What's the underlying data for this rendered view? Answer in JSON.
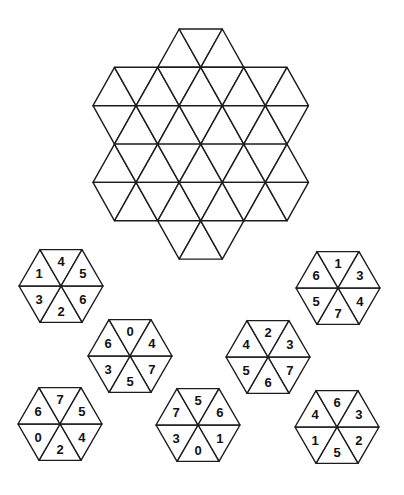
{
  "puzzle": {
    "grid": {
      "name": "triangle-grid-board",
      "origin_x": 93,
      "origin_y": 29,
      "half_side": 21.55,
      "row_height": 38.35,
      "bands": [
        {
          "row": 0,
          "upper": [
            4,
            6
          ],
          "lower": [
            3,
            5,
            7
          ]
        },
        {
          "row": 1,
          "upper": [
            1,
            3,
            5,
            7,
            9
          ],
          "lower": [
            0,
            2,
            4,
            6,
            8,
            10
          ]
        },
        {
          "row": 2,
          "upper": [
            0,
            2,
            4,
            6,
            8,
            10
          ],
          "lower": [
            1,
            3,
            5,
            7,
            9
          ]
        },
        {
          "row": 3,
          "upper": [
            1,
            3,
            5,
            7,
            9
          ],
          "lower": [
            0,
            2,
            4,
            6,
            8,
            10
          ]
        },
        {
          "row": 4,
          "upper": [
            0,
            2,
            4,
            6,
            8,
            10
          ],
          "lower": [
            1,
            3,
            5,
            7,
            9
          ]
        },
        {
          "row": 5,
          "upper": [
            3,
            5,
            7
          ],
          "lower": [
            4,
            6
          ]
        }
      ],
      "triangle_count": 42
    },
    "pieces": [
      {
        "id": 1,
        "cx": 61,
        "cy": 286,
        "r": 42,
        "sectors": {
          "top": "4",
          "top_right": "5",
          "bottom_right": "6",
          "bottom": "2",
          "bottom_left": "3",
          "top_left": "1"
        }
      },
      {
        "id": 2,
        "cx": 338,
        "cy": 288,
        "r": 42,
        "sectors": {
          "top": "1",
          "top_right": "3",
          "bottom_right": "4",
          "bottom": "7",
          "bottom_left": "5",
          "top_left": "6"
        }
      },
      {
        "id": 3,
        "cx": 130,
        "cy": 356,
        "r": 42,
        "sectors": {
          "top": "0",
          "top_right": "4",
          "bottom_right": "7",
          "bottom": "5",
          "bottom_left": "3",
          "top_left": "6"
        }
      },
      {
        "id": 4,
        "cx": 268,
        "cy": 357,
        "r": 42,
        "sectors": {
          "top": "2",
          "top_right": "3",
          "bottom_right": "7",
          "bottom": "6",
          "bottom_left": "5",
          "top_left": "4"
        }
      },
      {
        "id": 5,
        "cx": 60,
        "cy": 424,
        "r": 42,
        "sectors": {
          "top": "7",
          "top_right": "5",
          "bottom_right": "4",
          "bottom": "2",
          "bottom_left": "0",
          "top_left": "6"
        }
      },
      {
        "id": 6,
        "cx": 198,
        "cy": 425,
        "r": 42,
        "sectors": {
          "top": "5",
          "top_right": "6",
          "bottom_right": "1",
          "bottom": "0",
          "bottom_left": "3",
          "top_left": "7"
        }
      },
      {
        "id": 7,
        "cx": 337,
        "cy": 427,
        "r": 42,
        "sectors": {
          "top": "6",
          "top_right": "3",
          "bottom_right": "2",
          "bottom": "5",
          "bottom_left": "1",
          "top_left": "4"
        }
      }
    ],
    "colors": {
      "line": "#1c1c1c",
      "fill": "#ffffff",
      "text": "#111111",
      "background": "#ffffff"
    }
  }
}
